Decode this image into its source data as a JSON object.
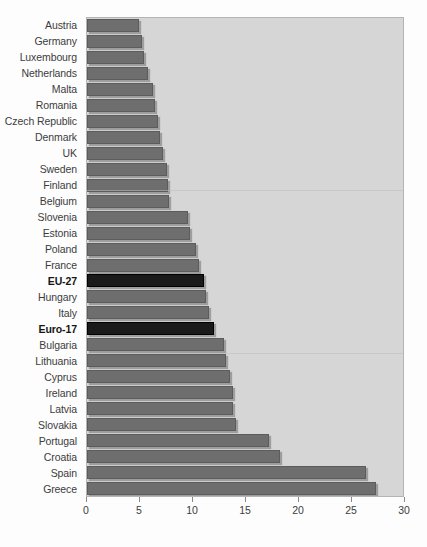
{
  "chart_data": {
    "type": "bar",
    "orientation": "horizontal",
    "title": "",
    "subtitle": "",
    "xlabel": "",
    "ylabel": "",
    "xlim": [
      0,
      30
    ],
    "ylim": null,
    "grid": false,
    "legend": null,
    "xticks": [
      0,
      5,
      10,
      15,
      20,
      25,
      30
    ],
    "xtick_labels": [
      "0",
      "5",
      "10",
      "15",
      "20",
      "25",
      "30"
    ],
    "categories": [
      "Austria",
      "Germany",
      "Luxembourg",
      "Netherlands",
      "Malta",
      "Romania",
      "Czech Republic",
      "Denmark",
      "UK",
      "Sweden",
      "Finland",
      "Belgium",
      "Slovenia",
      "Estonia",
      "Poland",
      "France",
      "EU-27",
      "Hungary",
      "Italy",
      "Euro-17",
      "Bulgaria",
      "Lithuania",
      "Cyprus",
      "Ireland",
      "Latvia",
      "Slovakia",
      "Portugal",
      "Croatia",
      "Spain",
      "Greece"
    ],
    "values": [
      4.9,
      5.2,
      5.4,
      5.8,
      6.2,
      6.4,
      6.7,
      6.9,
      7.2,
      7.5,
      7.6,
      7.7,
      9.5,
      9.7,
      10.3,
      10.6,
      11.0,
      11.2,
      11.5,
      12.0,
      12.9,
      13.1,
      13.5,
      13.8,
      13.8,
      14.1,
      17.2,
      18.2,
      26.3,
      27.3
    ],
    "highlighted_categories": [
      "EU-27",
      "Euro-17"
    ],
    "colors": {
      "bar": "#6e6e6e",
      "bar_highlight": "#1a1a1a",
      "plot_background": "#d6d6d6",
      "plot_border": "#b4b4b4",
      "label_text": "#3c3c3c",
      "page_background": "#fdfdfd"
    }
  }
}
